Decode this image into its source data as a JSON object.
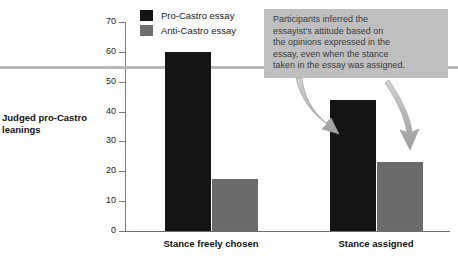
{
  "chart_data": {
    "type": "bar",
    "title": "",
    "xlabel": "",
    "ylabel": "Judged pro-Castro leanings",
    "ylim": [
      0,
      70
    ],
    "yticks": [
      0,
      10,
      20,
      30,
      40,
      50,
      60,
      70
    ],
    "ytick_labels": [
      "0",
      "10",
      "20",
      "30",
      "40",
      "50",
      "60",
      "70"
    ],
    "grid": false,
    "legend_position": "top-left",
    "categories": [
      "Stance freely chosen",
      "Stance assigned"
    ],
    "series": [
      {
        "name": "Pro-Castro essay",
        "color": "#141414",
        "values": [
          60,
          44
        ]
      },
      {
        "name": "Anti-Castro essay",
        "color": "#6b6b6b",
        "values": [
          17.5,
          23
        ]
      }
    ],
    "reference_line": {
      "value": 55,
      "color": "#b9b9b9"
    },
    "annotations": [
      {
        "text": "Participants inferred the essayist's attitude based on the opinions expressed in the essay, even when the stance taken in the essay was assigned.",
        "background": "#bfbfbf",
        "arrows": [
          {
            "target": "Pro-Castro essay bar, Stance assigned"
          },
          {
            "target": "Anti-Castro essay bar, Stance assigned"
          }
        ]
      }
    ]
  },
  "legend": {
    "items": [
      {
        "label": "Pro-Castro essay",
        "swatch": "pro"
      },
      {
        "label": "Anti-Castro essay",
        "swatch": "anti"
      }
    ]
  },
  "axis": {
    "y_label_line1": "Judged pro-Castro",
    "y_label_line2": "leanings"
  },
  "annotation": {
    "line1": "Participants inferred the",
    "line2": "essayist's attitude based on",
    "line3": "the opinions expressed in the",
    "line4": "essay, even when the stance",
    "line5": "taken in the essay was assigned."
  }
}
